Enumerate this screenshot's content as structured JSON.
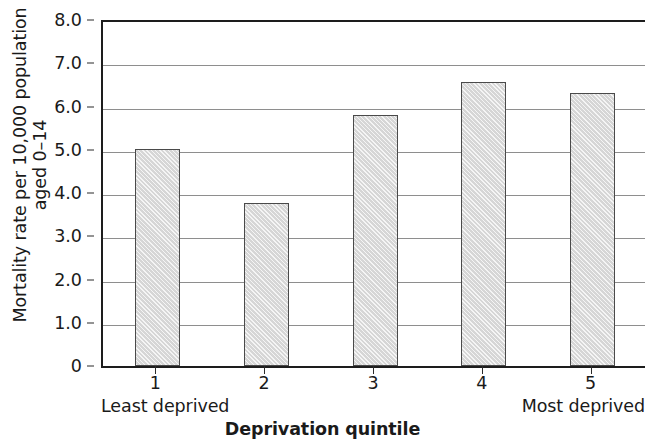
{
  "chart_data": {
    "type": "bar",
    "title": "",
    "subtitle": "",
    "xlabel": "Deprivation quintile",
    "ylabel": "Mortality rate per 10,000 population aged 0–14",
    "ylabel_lines": [
      "Mortality rate per 10,000 population",
      "aged 0–14"
    ],
    "categories": [
      "1",
      "2",
      "3",
      "4",
      "5"
    ],
    "values": [
      5.02,
      3.77,
      5.8,
      6.57,
      6.31
    ],
    "series": [
      {
        "name": "Mortality rate",
        "values": [
          5.02,
          3.77,
          5.8,
          6.57,
          6.31
        ]
      }
    ],
    "ylim": [
      0,
      8.0
    ],
    "ytick_values": [
      0,
      1.0,
      2.0,
      3.0,
      4.0,
      5.0,
      6.0,
      7.0,
      8.0
    ],
    "ytick_labels": [
      "0",
      "1.0",
      "2.0",
      "3.0",
      "4.0",
      "5.0",
      "6.0",
      "7.0",
      "8.0"
    ],
    "xtick_labels": [
      "1",
      "2",
      "3",
      "4",
      "5"
    ],
    "annotations": [
      {
        "name": "least-deprived",
        "text": "Least deprived",
        "position": "below-axis-left"
      },
      {
        "name": "most-deprived",
        "text": "Most deprived",
        "position": "below-axis-right"
      }
    ],
    "grid": "horizontal",
    "legend": "none",
    "bar_fill_color": "#d6d6d6",
    "bar_edge_color": "#4a4a4a",
    "gridline_color": "#8e8e8e",
    "axis_color": "#1d1d1d"
  },
  "axes": {
    "x_title": "Deprivation quintile",
    "y_title_line1": "Mortality rate per 10,000 population",
    "y_title_line2": "aged 0–14",
    "least_deprived_label": "Least deprived",
    "most_deprived_label": "Most deprived"
  }
}
